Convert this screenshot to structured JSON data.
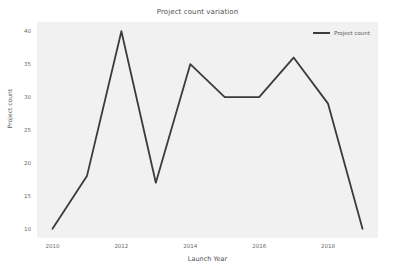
{
  "chart_data": {
    "type": "line",
    "title": "Project count variation",
    "xlabel": "Launch Year",
    "ylabel": "Project count",
    "x": [
      2010,
      2011,
      2012,
      2013,
      2014,
      2015,
      2016,
      2017,
      2018,
      2019
    ],
    "values": [
      10,
      18,
      40,
      17,
      35,
      30,
      30,
      36,
      29,
      10
    ],
    "series": [
      {
        "name": "Project count",
        "values": [
          10,
          18,
          40,
          17,
          35,
          30,
          30,
          36,
          29,
          10
        ]
      }
    ],
    "xlim": [
      2009.55,
      2019.45
    ],
    "ylim": [
      8.6,
      41.4
    ],
    "xticks": [
      2010,
      2012,
      2014,
      2016,
      2018
    ],
    "xtick_labels": [
      "2010",
      "2012",
      "2014",
      "2016",
      "2018"
    ],
    "yticks": [
      10,
      15,
      20,
      25,
      30,
      35,
      40
    ],
    "ytick_labels": [
      "10",
      "15",
      "20",
      "25",
      "30",
      "35",
      "40"
    ],
    "grid": false,
    "legend_position": "upper right",
    "line_color": "#3b3b3b",
    "plot_background": "#f1f1f1",
    "figure_background": "#ffffff"
  },
  "legend": {
    "entries": [
      {
        "label": "Project count",
        "color": "#3b3b3b"
      }
    ]
  }
}
